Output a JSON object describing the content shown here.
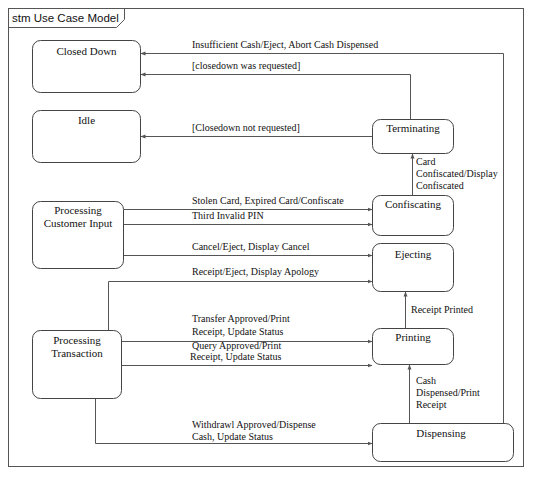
{
  "diagram": {
    "type": "state-machine",
    "frame_title": "stm Use Case Model",
    "colors": {
      "line": "#555555",
      "text": "#111111",
      "background": "#ffffff"
    },
    "states": [
      {
        "id": "closed_down",
        "lines": [
          "Closed Down"
        ]
      },
      {
        "id": "idle",
        "lines": [
          "Idle"
        ]
      },
      {
        "id": "processing_customer_input",
        "lines": [
          "Processing",
          "Customer Input"
        ]
      },
      {
        "id": "processing_transaction",
        "lines": [
          "Processing",
          "Transaction"
        ]
      },
      {
        "id": "terminating",
        "lines": [
          "Terminating"
        ]
      },
      {
        "id": "confiscating",
        "lines": [
          "Confiscating"
        ]
      },
      {
        "id": "ejecting",
        "lines": [
          "Ejecting"
        ]
      },
      {
        "id": "printing",
        "lines": [
          "Printing"
        ]
      },
      {
        "id": "dispensing",
        "lines": [
          "Dispensing"
        ]
      }
    ],
    "transitions": [
      {
        "id": "t_insufficient_cash",
        "from": "dispensing",
        "to": "closed_down",
        "lines": [
          "Insufficient Cash/Eject, Abort Cash Dispensed"
        ]
      },
      {
        "id": "t_closedown_requested",
        "from": "terminating",
        "to": "closed_down",
        "lines": [
          "[closedown was requested]"
        ]
      },
      {
        "id": "t_closedown_not_requested",
        "from": "terminating",
        "to": "idle",
        "lines": [
          "[Closedown not requested]"
        ]
      },
      {
        "id": "t_card_confiscated",
        "from": "confiscating",
        "to": "terminating",
        "lines": [
          "Card",
          "Confiscated/Display",
          "Confiscated"
        ]
      },
      {
        "id": "t_stolen_card",
        "from": "processing_customer_input",
        "to": "confiscating",
        "lines": [
          "Stolen Card, Expired Card/Confiscate"
        ]
      },
      {
        "id": "t_third_invalid_pin",
        "from": "processing_customer_input",
        "to": "confiscating",
        "lines": [
          "Third Invalid PIN"
        ]
      },
      {
        "id": "t_cancel_eject",
        "from": "processing_customer_input",
        "to": "ejecting",
        "lines": [
          "Cancel/Eject, Display Cancel"
        ]
      },
      {
        "id": "t_receipt_eject",
        "from": "processing_transaction",
        "to": "ejecting",
        "lines": [
          "Receipt/Eject, Display Apology"
        ]
      },
      {
        "id": "t_receipt_printed",
        "from": "printing",
        "to": "ejecting",
        "lines": [
          "Receipt Printed"
        ]
      },
      {
        "id": "t_transfer_approved",
        "from": "processing_transaction",
        "to": "printing",
        "lines": [
          "Transfer Approved/Print",
          "Receipt, Update Status"
        ]
      },
      {
        "id": "t_query_approved",
        "from": "processing_transaction",
        "to": "printing",
        "lines": [
          "Query Approved/Print",
          "Receipt, Update Status"
        ]
      },
      {
        "id": "t_cash_dispensed",
        "from": "dispensing",
        "to": "printing",
        "lines": [
          "Cash",
          "Dispensed/Print",
          "Receipt"
        ]
      },
      {
        "id": "t_withdrawl_approved",
        "from": "processing_transaction",
        "to": "dispensing",
        "lines": [
          "Withdrawl Approved/Dispense",
          "Cash, Update Status"
        ]
      }
    ]
  }
}
